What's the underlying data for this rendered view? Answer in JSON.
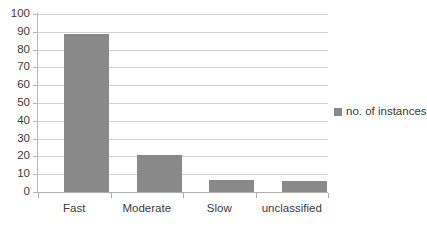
{
  "chart_data": {
    "type": "bar",
    "title": "",
    "xlabel": "",
    "ylabel": "",
    "categories": [
      "Fast",
      "Moderate",
      "Slow",
      "unclassified"
    ],
    "values": [
      89,
      21,
      7,
      6
    ],
    "series": [
      {
        "name": "no. of instances",
        "values": [
          89,
          21,
          7,
          6
        ]
      }
    ],
    "ylim": [
      0,
      100
    ],
    "ytick_labels": [
      "0",
      "10",
      "20",
      "30",
      "40",
      "50",
      "60",
      "70",
      "80",
      "90",
      "100"
    ],
    "ytick_values": [
      0,
      10,
      20,
      30,
      40,
      50,
      60,
      70,
      80,
      90,
      100
    ],
    "grid": true,
    "legend": {
      "position": "right",
      "entries": [
        {
          "label": "no. of instances",
          "color": "#898989",
          "marker": "legend-square-marker"
        }
      ]
    },
    "colors": {
      "bar": "#898989",
      "gridline": "#d2d2d2",
      "axis": "#b0b0b0",
      "text": "#3b3b3b",
      "background": "#ffffff"
    }
  }
}
